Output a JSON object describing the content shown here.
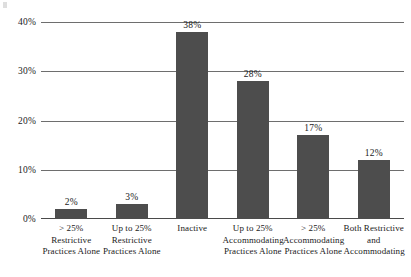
{
  "chart_data": {
    "type": "bar",
    "title": "",
    "xlabel": "",
    "ylabel": "",
    "ylim": [
      0,
      40
    ],
    "grid": true,
    "legend": "none",
    "bar_color": "#4d4d4d",
    "categories": [
      "> 25% Restrictive\nPractices Alone",
      "Up to 25%\nRestrictive\nPractices Alone",
      "Inactive",
      "Up to 25%\nAccommodating\nPractices Alone",
      "> 25%\nAccommodating\nPractices Alone",
      "Both Restrictive\nand\nAccommodating"
    ],
    "category_lines": [
      [
        "> 25% Restrictive",
        "Practices Alone"
      ],
      [
        "Up to 25%",
        "Restrictive",
        "Practices Alone"
      ],
      [
        "Inactive"
      ],
      [
        "Up to 25%",
        "Accommodating",
        "Practices Alone"
      ],
      [
        "> 25%",
        "Accommodating",
        "Practices Alone"
      ],
      [
        "Both Restrictive",
        "and",
        "Accommodating"
      ]
    ],
    "values": [
      2,
      3,
      38,
      28,
      17,
      12
    ],
    "value_labels": [
      "2%",
      "3%",
      "38%",
      "28%",
      "17%",
      "12%"
    ],
    "yticks": [
      0,
      10,
      20,
      30,
      40
    ],
    "ytick_labels": [
      "0%",
      "10%",
      "20%",
      "30%",
      "40%"
    ]
  }
}
